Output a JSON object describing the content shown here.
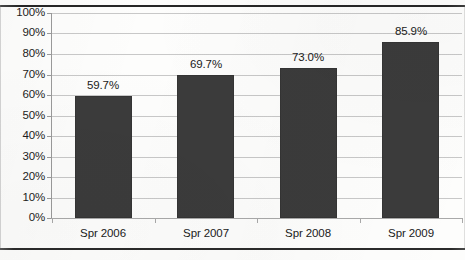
{
  "chart_data": {
    "type": "bar",
    "title": "",
    "subtitle": "",
    "xlabel": "",
    "ylabel": "",
    "categories": [
      "Spr 2006",
      "Spr 2007",
      "Spr 2008",
      "Spr 2009"
    ],
    "values": [
      59.7,
      69.7,
      73.0,
      85.9
    ],
    "data_labels": [
      "59.7%",
      "69.7%",
      "73.0%",
      "85.9%"
    ],
    "ylim": [
      0,
      100
    ],
    "ytick_step": 10,
    "ytick_labels": [
      "100%",
      "90%",
      "80%",
      "70%",
      "60%",
      "50%",
      "40%",
      "30%",
      "20%",
      "10%",
      "0%"
    ],
    "ytick_values": [
      100,
      90,
      80,
      70,
      60,
      50,
      40,
      30,
      20,
      10,
      0
    ],
    "grid": true,
    "grid_orientation": "horizontal",
    "legend": false,
    "legend_position": "none",
    "bar_color": "#3b3b3b",
    "gridline_color": "#c8c8c8",
    "axis_color": "#9a9a9a",
    "background_color": "#ffffff",
    "text_color": "#1a1a1a"
  }
}
